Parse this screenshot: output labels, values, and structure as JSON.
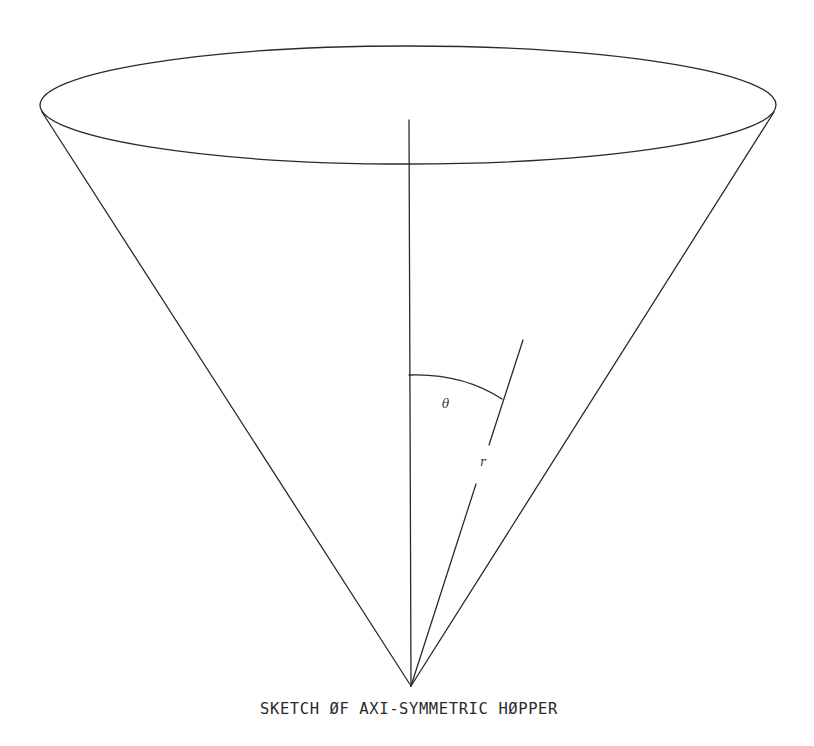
{
  "diagram": {
    "caption": "SKETCH ØF AXI-SYMMETRIC HØPPER",
    "labels": {
      "angle": "θ",
      "radius": "r"
    },
    "colors": {
      "background": "#ffffff",
      "ink": "#2a2a2a"
    },
    "elements": [
      "cone-rim-ellipse",
      "cone-left-side",
      "cone-right-side",
      "central-axis",
      "radius-line",
      "theta-arc"
    ]
  }
}
